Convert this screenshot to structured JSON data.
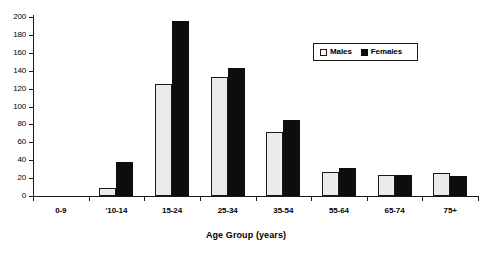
{
  "chart_data": {
    "type": "bar",
    "title": "",
    "xlabel": "Age Group (years)",
    "ylabel": "",
    "categories": [
      "0-9",
      "'10-14",
      "15-24",
      "25-34",
      "35-54",
      "55-64",
      "65-74",
      "75+"
    ],
    "series": [
      {
        "name": "Males",
        "values": [
          0,
          9,
          125,
          133,
          71,
          27,
          24,
          26
        ]
      },
      {
        "name": "Females",
        "values": [
          0,
          38,
          195,
          143,
          85,
          31,
          23,
          22
        ]
      }
    ],
    "ylim": [
      0,
      200
    ],
    "yticks": [
      0,
      20,
      40,
      60,
      80,
      100,
      120,
      140,
      160,
      180,
      200
    ],
    "ytick_labels": [
      "0",
      "20",
      "40",
      "60",
      "80",
      "100",
      "120",
      "140",
      "160",
      "180",
      "200"
    ],
    "grid": false,
    "legend": {
      "position": "top-right",
      "entries": [
        {
          "label": "Males",
          "swatch": "white-outlined",
          "color": "#ebebeb"
        },
        {
          "label": "Females",
          "swatch": "solid",
          "color": "#0d0d0d"
        }
      ]
    },
    "colors": {
      "male_fill": "#ebebeb",
      "male_edge": "#1a1a1a",
      "female_fill": "#0d0d0d",
      "axis": "#1a1a1a",
      "background": "#ffffff"
    }
  }
}
